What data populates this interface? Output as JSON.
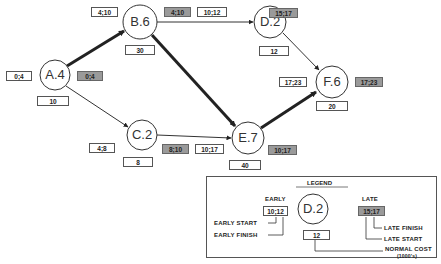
{
  "diagram": {
    "type": "activity-on-node network (critical path)",
    "colors": {
      "critical_path": "#222222",
      "shaded_box": "#9a9a9a",
      "line": "#333333"
    },
    "nodes": [
      {
        "id": "A",
        "label": "A.4",
        "left_box": "0;4",
        "right_box": "0;4",
        "cost": "10"
      },
      {
        "id": "B",
        "label": "B.6",
        "top_box": "4;10",
        "right_early": "10;12",
        "right_late": "4;10",
        "cost": "30"
      },
      {
        "id": "C",
        "label": "C.2",
        "left_box": "4;8",
        "right_box": "8;10",
        "cost": "8"
      },
      {
        "id": "D",
        "label": "D.2",
        "right_box": "15;17",
        "cost": "12"
      },
      {
        "id": "E",
        "label": "E.7",
        "left_box": "10;17",
        "right_box": "10;17",
        "cost": "40"
      },
      {
        "id": "F",
        "label": "F.6",
        "left_box": "17;23",
        "right_box": "17;23",
        "cost": "20"
      }
    ],
    "edges": [
      {
        "from": "A",
        "to": "B",
        "critical": true
      },
      {
        "from": "A",
        "to": "C",
        "critical": false
      },
      {
        "from": "B",
        "to": "D",
        "critical": false
      },
      {
        "from": "B",
        "to": "E",
        "critical": true
      },
      {
        "from": "C",
        "to": "E",
        "critical": false
      },
      {
        "from": "D",
        "to": "F",
        "critical": false
      },
      {
        "from": "E",
        "to": "F",
        "critical": true
      }
    ]
  },
  "labels": {
    "a_node": "A.4",
    "a_early": "0;4",
    "a_late": "0;4",
    "a_cost": "10",
    "b_node": "B.6",
    "b_early": "4;10",
    "b_late": "4;10",
    "b_cost": "30",
    "bd_early": "10;12",
    "c_node": "C.2",
    "c_early": "4;8",
    "c_late": "8;10",
    "c_cost": "8",
    "d_node": "D.2",
    "d_late": "15;17",
    "d_cost": "12",
    "e_node": "E.7",
    "e_early": "10;17",
    "e_late": "10;17",
    "e_cost": "40",
    "f_node": "F.6",
    "f_early": "17;23",
    "f_late": "17;23",
    "f_cost": "20"
  },
  "legend": {
    "title": "LEGEND",
    "early_header": "EARLY",
    "early_value": "10;12",
    "early_start": "EARLY START",
    "early_finish": "EARLY FINISH",
    "node_label": "D.2",
    "cost_value": "12",
    "late_header": "LATE",
    "late_value": "15;17",
    "late_finish": "LATE FINISH",
    "late_start": "LATE START",
    "normal_cost": "NORMAL COST",
    "normal_cost_unit": "(1000's)"
  }
}
